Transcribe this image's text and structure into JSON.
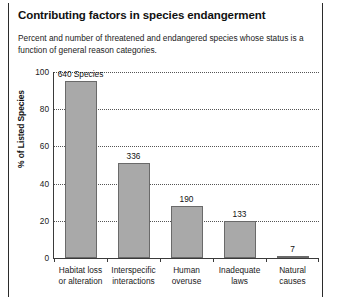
{
  "chart_data": {
    "type": "bar",
    "title": "Contributing factors in species endangerment",
    "subtitle": "Percent and number of threatened and endangered species whose status is a function of general reason categories.",
    "xlabel": "",
    "ylabel": "% of Listed Species",
    "ylim": [
      0,
      100
    ],
    "yticks": [
      0,
      20,
      40,
      60,
      80,
      100
    ],
    "grid": true,
    "legend": "none",
    "categories": [
      "Habitat loss or alteration",
      "Interspecific interactions",
      "Human overuse",
      "Inadequate laws",
      "Natural causes"
    ],
    "category_lines": [
      [
        "Habitat loss",
        "or alteration"
      ],
      [
        "Interspecific",
        "interactions"
      ],
      [
        "Human",
        "overuse"
      ],
      [
        "Inadequate",
        "laws"
      ],
      [
        "Natural",
        "causes"
      ]
    ],
    "values": [
      95,
      51,
      28,
      20,
      1
    ],
    "data_labels": [
      "640 Species",
      "336",
      "190",
      "133",
      "7"
    ],
    "bar_color": "#a9a9a9",
    "bar_border_color": "#6a6a6a"
  }
}
